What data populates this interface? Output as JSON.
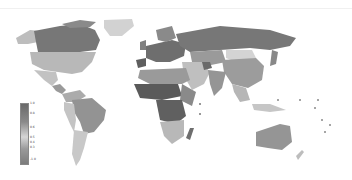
{
  "map": {
    "type": "choropleth world map",
    "palette": "grayscale",
    "colors": {
      "ocean": "#ffffff",
      "darkest": "#555555",
      "dark": "#747474",
      "medium": "#9a9a9a",
      "light": "#bdbdbd",
      "lightest": "#d9d9d9"
    },
    "regions": [
      {
        "name": "Canada",
        "shade": "dark"
      },
      {
        "name": "Alaska",
        "shade": "light"
      },
      {
        "name": "Greenland",
        "shade": "lightest"
      },
      {
        "name": "United States",
        "shade": "light"
      },
      {
        "name": "Mexico",
        "shade": "light"
      },
      {
        "name": "Central America",
        "shade": "medium"
      },
      {
        "name": "Brazil",
        "shade": "medium"
      },
      {
        "name": "Andean South America",
        "shade": "light"
      },
      {
        "name": "Argentina",
        "shade": "light"
      },
      {
        "name": "Europe",
        "shade": "dark"
      },
      {
        "name": "Iberia",
        "shade": "darkest"
      },
      {
        "name": "Russia",
        "shade": "dark"
      },
      {
        "name": "Central Asia",
        "shade": "medium"
      },
      {
        "name": "Mongolia",
        "shade": "lightest"
      },
      {
        "name": "China",
        "shade": "medium"
      },
      {
        "name": "India",
        "shade": "medium"
      },
      {
        "name": "Middle East",
        "shade": "light"
      },
      {
        "name": "North Africa",
        "shade": "medium"
      },
      {
        "name": "Sahel",
        "shade": "darkest"
      },
      {
        "name": "Central Africa",
        "shade": "darkest"
      },
      {
        "name": "Southern Africa",
        "shade": "light"
      },
      {
        "name": "Madagascar",
        "shade": "dark"
      },
      {
        "name": "Southeast Asia",
        "shade": "light"
      },
      {
        "name": "Australia",
        "shade": "medium"
      },
      {
        "name": "New Zealand",
        "shade": "light"
      }
    ]
  },
  "legend": {
    "orientation": "vertical",
    "ticks": [
      "1.0",
      "0.8",
      "0.6",
      "0.5",
      "0.4",
      "0.3",
      "-1.0"
    ]
  }
}
